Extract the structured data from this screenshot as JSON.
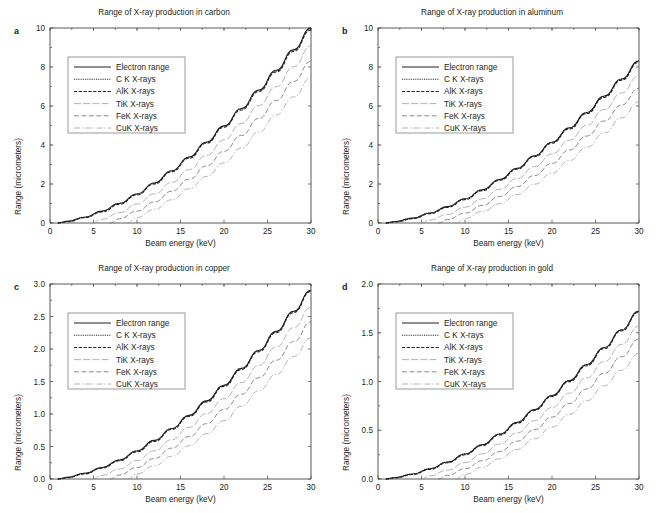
{
  "figure": {
    "panels": [
      {
        "letter": "a",
        "title": "Range of X-ray production in carbon",
        "xlabel": "Beam energy (keV)",
        "ylabel": "Range (micrometers)",
        "xticks": [
          "0",
          "5",
          "10",
          "15",
          "20",
          "25",
          "30"
        ],
        "yticks": [
          "0",
          "2",
          "4",
          "6",
          "8",
          "10"
        ]
      },
      {
        "letter": "b",
        "title": "Range of X-ray production in aluminum",
        "xlabel": "Beam energy (keV)",
        "ylabel": "Range (micrometers)",
        "xticks": [
          "0",
          "5",
          "10",
          "15",
          "20",
          "25",
          "30"
        ],
        "yticks": [
          "0",
          "2",
          "4",
          "6",
          "8",
          "10"
        ]
      },
      {
        "letter": "c",
        "title": "Range of X-ray production in copper",
        "xlabel": "Beam energy (keV)",
        "ylabel": "Range (micrometers)",
        "xticks": [
          "0",
          "5",
          "10",
          "15",
          "20",
          "25",
          "30"
        ],
        "yticks": [
          "0.0",
          "0.5",
          "1.0",
          "1.5",
          "2.0",
          "2.5",
          "3.0"
        ]
      },
      {
        "letter": "d",
        "title": "Range of X-ray production in gold",
        "xlabel": "Beam energy (keV)",
        "ylabel": "Range (micrometers)",
        "xticks": [
          "0",
          "5",
          "10",
          "15",
          "20",
          "25",
          "30"
        ],
        "yticks": [
          "0.0",
          "0.5",
          "1.0",
          "1.5",
          "2.0"
        ]
      }
    ],
    "legend_labels": [
      "Electron range",
      "C K X-rays",
      "AlK X-rays",
      "TiK X-rays",
      "FeK X-rays",
      "CuK X-rays"
    ]
  },
  "chart_data": [
    {
      "type": "line",
      "panel": "a",
      "title": "Range of X-ray production in carbon",
      "xlabel": "Beam energy (keV)",
      "ylabel": "Range (micrometers)",
      "xlim": [
        0,
        30
      ],
      "ylim": [
        0,
        10
      ],
      "xticks": [
        0,
        5,
        10,
        15,
        20,
        25,
        30
      ],
      "yticks": [
        0,
        2,
        4,
        6,
        8,
        10
      ],
      "grid": false,
      "legend_position": "upper left",
      "x": [
        0,
        2,
        4,
        6,
        8,
        10,
        12,
        14,
        16,
        18,
        20,
        22,
        24,
        26,
        28,
        30
      ],
      "series": [
        {
          "name": "Electron range",
          "style": "solid",
          "values": [
            0.0,
            0.09,
            0.3,
            0.61,
            1.01,
            1.49,
            2.05,
            2.68,
            3.38,
            4.15,
            4.98,
            5.87,
            6.82,
            7.83,
            8.89,
            10.0
          ]
        },
        {
          "name": "C K X-rays",
          "style": "dotted",
          "edge_keV": 0.28,
          "values": [
            0.0,
            0.09,
            0.3,
            0.61,
            1.0,
            1.48,
            2.04,
            2.67,
            3.37,
            4.13,
            4.96,
            5.85,
            6.79,
            7.8,
            8.86,
            9.96
          ]
        },
        {
          "name": "AlK X-rays",
          "style": "dashed",
          "edge_keV": 1.56,
          "values": [
            0.0,
            0.06,
            0.27,
            0.57,
            0.96,
            1.44,
            2.0,
            2.63,
            3.32,
            4.09,
            4.91,
            5.8,
            6.74,
            7.74,
            8.8,
            9.9
          ]
        },
        {
          "name": "TiK X-rays",
          "style": "longdash-thin",
          "edge_keV": 4.97,
          "values": [
            0.0,
            0.0,
            0.0,
            0.19,
            0.53,
            0.97,
            1.49,
            2.08,
            2.74,
            3.47,
            4.26,
            5.11,
            6.02,
            6.99,
            8.01,
            9.08
          ]
        },
        {
          "name": "FeK X-rays",
          "style": "dash",
          "edge_keV": 7.11,
          "values": [
            0.0,
            0.0,
            0.0,
            0.0,
            0.22,
            0.61,
            1.08,
            1.63,
            2.25,
            2.93,
            3.68,
            4.49,
            5.36,
            6.28,
            7.26,
            8.29
          ]
        },
        {
          "name": "CuK X-rays",
          "style": "dashdot",
          "edge_keV": 8.98,
          "values": [
            0.0,
            0.0,
            0.0,
            0.0,
            0.0,
            0.28,
            0.7,
            1.19,
            1.76,
            2.39,
            3.08,
            3.84,
            4.66,
            5.54,
            6.47,
            7.45
          ]
        }
      ]
    },
    {
      "type": "line",
      "panel": "b",
      "title": "Range of X-ray production in aluminum",
      "xlabel": "Beam energy (keV)",
      "ylabel": "Range (micrometers)",
      "xlim": [
        0,
        30
      ],
      "ylim": [
        0,
        10
      ],
      "xticks": [
        0,
        5,
        10,
        15,
        20,
        25,
        30
      ],
      "yticks": [
        0,
        2,
        4,
        6,
        8,
        10
      ],
      "grid": false,
      "legend_position": "upper left",
      "x": [
        0,
        2,
        4,
        6,
        8,
        10,
        12,
        14,
        16,
        18,
        20,
        22,
        24,
        26,
        28,
        30
      ],
      "series": [
        {
          "name": "Electron range",
          "style": "solid",
          "values": [
            0.0,
            0.08,
            0.25,
            0.51,
            0.84,
            1.24,
            1.71,
            2.23,
            2.81,
            3.45,
            4.14,
            4.88,
            5.67,
            6.51,
            7.39,
            8.32
          ]
        },
        {
          "name": "C K X-rays",
          "style": "dotted",
          "edge_keV": 0.28,
          "values": [
            0.0,
            0.08,
            0.25,
            0.51,
            0.84,
            1.23,
            1.7,
            2.22,
            2.8,
            3.44,
            4.13,
            4.86,
            5.65,
            6.49,
            7.37,
            8.29
          ]
        },
        {
          "name": "AlK X-rays",
          "style": "dashed",
          "edge_keV": 1.56,
          "values": [
            0.0,
            0.05,
            0.22,
            0.48,
            0.8,
            1.2,
            1.66,
            2.19,
            2.76,
            3.4,
            4.09,
            4.82,
            5.61,
            6.44,
            7.32,
            8.24
          ]
        },
        {
          "name": "TiK X-rays",
          "style": "longdash-thin",
          "edge_keV": 4.97,
          "values": [
            0.0,
            0.0,
            0.0,
            0.16,
            0.44,
            0.81,
            1.24,
            1.73,
            2.28,
            2.89,
            3.54,
            4.25,
            5.01,
            5.82,
            6.67,
            7.56
          ]
        },
        {
          "name": "FeK X-rays",
          "style": "dash",
          "edge_keV": 7.11,
          "values": [
            0.0,
            0.0,
            0.0,
            0.0,
            0.18,
            0.51,
            0.9,
            1.36,
            1.87,
            2.44,
            3.06,
            3.74,
            4.46,
            5.23,
            6.05,
            6.91
          ]
        },
        {
          "name": "CuK X-rays",
          "style": "dashdot",
          "edge_keV": 8.98,
          "values": [
            0.0,
            0.0,
            0.0,
            0.0,
            0.0,
            0.23,
            0.59,
            0.99,
            1.46,
            1.99,
            2.56,
            3.2,
            3.88,
            4.61,
            5.39,
            6.21
          ]
        }
      ]
    },
    {
      "type": "line",
      "panel": "c",
      "title": "Range of X-ray production in copper",
      "xlabel": "Beam energy (keV)",
      "ylabel": "Range (micrometers)",
      "xlim": [
        0,
        30
      ],
      "ylim": [
        0,
        3.0
      ],
      "xticks": [
        0,
        5,
        10,
        15,
        20,
        25,
        30
      ],
      "yticks": [
        0.0,
        0.5,
        1.0,
        1.5,
        2.0,
        2.5,
        3.0
      ],
      "grid": false,
      "legend_position": "upper left",
      "x": [
        0,
        2,
        4,
        6,
        8,
        10,
        12,
        14,
        16,
        18,
        20,
        22,
        24,
        26,
        28,
        30
      ],
      "series": [
        {
          "name": "Electron range",
          "style": "solid",
          "values": [
            0.0,
            0.027,
            0.088,
            0.178,
            0.293,
            0.432,
            0.594,
            0.777,
            0.979,
            1.202,
            1.443,
            1.702,
            1.978,
            2.271,
            2.58,
            2.905
          ]
        },
        {
          "name": "C K X-rays",
          "style": "dotted",
          "edge_keV": 0.28,
          "values": [
            0.0,
            0.026,
            0.087,
            0.177,
            0.292,
            0.431,
            0.592,
            0.775,
            0.977,
            1.199,
            1.44,
            1.698,
            1.974,
            2.266,
            2.575,
            2.899
          ]
        },
        {
          "name": "AlK X-rays",
          "style": "dashed",
          "edge_keV": 1.56,
          "values": [
            0.0,
            0.018,
            0.078,
            0.167,
            0.281,
            0.418,
            0.579,
            0.761,
            0.963,
            1.185,
            1.425,
            1.683,
            1.959,
            2.251,
            2.56,
            2.884
          ]
        },
        {
          "name": "TiK X-rays",
          "style": "longdash-thin",
          "edge_keV": 4.97,
          "values": [
            0.0,
            0.0,
            0.0,
            0.056,
            0.154,
            0.283,
            0.434,
            0.605,
            0.796,
            1.007,
            1.236,
            1.483,
            1.747,
            2.029,
            2.327,
            2.641
          ]
        },
        {
          "name": "FeK X-rays",
          "style": "dash",
          "edge_keV": 7.11,
          "values": [
            0.0,
            0.0,
            0.0,
            0.0,
            0.063,
            0.177,
            0.316,
            0.475,
            0.654,
            0.852,
            1.069,
            1.304,
            1.557,
            1.827,
            2.113,
            2.416
          ]
        },
        {
          "name": "CuK X-rays",
          "style": "dashdot",
          "edge_keV": 8.98,
          "values": [
            0.0,
            0.0,
            0.0,
            0.0,
            0.0,
            0.079,
            0.205,
            0.349,
            0.512,
            0.696,
            0.898,
            1.118,
            1.356,
            1.611,
            1.883,
            2.171
          ]
        }
      ]
    },
    {
      "type": "line",
      "panel": "d",
      "title": "Range of X-ray production in gold",
      "xlabel": "Beam energy (keV)",
      "ylabel": "Range (micrometers)",
      "xlim": [
        0,
        30
      ],
      "ylim": [
        0,
        2.0
      ],
      "xticks": [
        0,
        5,
        10,
        15,
        20,
        25,
        30
      ],
      "yticks": [
        0.0,
        0.5,
        1.0,
        1.5,
        2.0
      ],
      "grid": false,
      "legend_position": "upper left",
      "x": [
        0,
        2,
        4,
        6,
        8,
        10,
        12,
        14,
        16,
        18,
        20,
        22,
        24,
        26,
        28,
        30
      ],
      "series": [
        {
          "name": "Electron range",
          "style": "solid",
          "values": [
            0.0,
            0.016,
            0.052,
            0.105,
            0.174,
            0.256,
            0.352,
            0.461,
            0.581,
            0.713,
            0.856,
            1.01,
            1.174,
            1.348,
            1.531,
            1.724
          ]
        },
        {
          "name": "C K X-rays",
          "style": "dotted",
          "edge_keV": 0.28,
          "values": [
            0.0,
            0.016,
            0.052,
            0.105,
            0.173,
            0.256,
            0.351,
            0.46,
            0.58,
            0.712,
            0.854,
            1.008,
            1.171,
            1.345,
            1.528,
            1.72
          ]
        },
        {
          "name": "AlK X-rays",
          "style": "dashed",
          "edge_keV": 1.56,
          "values": [
            0.0,
            0.011,
            0.046,
            0.099,
            0.167,
            0.248,
            0.343,
            0.452,
            0.571,
            0.703,
            0.846,
            0.999,
            1.162,
            1.336,
            1.519,
            1.712
          ]
        },
        {
          "name": "TiK X-rays",
          "style": "longdash-thin",
          "edge_keV": 4.97,
          "values": [
            0.0,
            0.0,
            0.0,
            0.033,
            0.091,
            0.168,
            0.257,
            0.359,
            0.473,
            0.598,
            0.733,
            0.88,
            1.037,
            1.204,
            1.381,
            1.567
          ]
        },
        {
          "name": "FeK X-rays",
          "style": "dash",
          "edge_keV": 7.11,
          "values": [
            0.0,
            0.0,
            0.0,
            0.0,
            0.037,
            0.105,
            0.188,
            0.282,
            0.388,
            0.506,
            0.634,
            0.774,
            0.924,
            1.084,
            1.254,
            1.434
          ]
        },
        {
          "name": "CuK X-rays",
          "style": "dashdot",
          "edge_keV": 8.98,
          "values": [
            0.0,
            0.0,
            0.0,
            0.0,
            0.0,
            0.047,
            0.122,
            0.207,
            0.304,
            0.413,
            0.533,
            0.663,
            0.804,
            0.956,
            1.117,
            1.288
          ]
        }
      ]
    }
  ]
}
